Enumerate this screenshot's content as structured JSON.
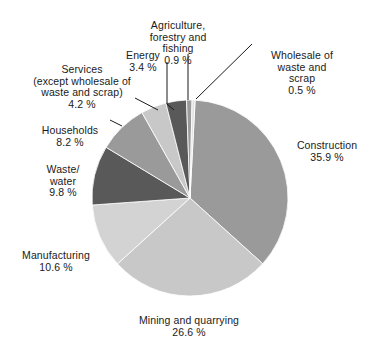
{
  "chart_data": {
    "type": "pie",
    "title": "",
    "unit": "%",
    "start_angle_deg": 3,
    "direction": "clockwise",
    "center": {
      "x": 190,
      "y": 198
    },
    "radius": 98,
    "categories": [
      "Construction",
      "Mining and quarrying",
      "Manufacturing",
      "Waste/ water",
      "Households",
      "Services (except wholesale of waste and scrap)",
      "Energy",
      "Agriculture, forestry and fishing",
      "Wholesale of waste and scrap"
    ],
    "values": [
      35.9,
      26.6,
      10.6,
      9.8,
      8.2,
      4.2,
      3.4,
      0.9,
      0.5
    ],
    "colors": [
      "#9a9a9a",
      "#c8c8c8",
      "#d3d3d3",
      "#595959",
      "#9a9a9a",
      "#c8c8c8",
      "#595959",
      "#9a9a9a",
      "#e2e2e2"
    ],
    "legend_position": "none",
    "grid": false,
    "slices": [
      {
        "name": "Construction",
        "value": 35.9,
        "value_label": "35.9 %",
        "color": "#9a9a9a"
      },
      {
        "name": "Mining and quarrying",
        "value": 26.6,
        "value_label": "26.6 %",
        "color": "#c8c8c8"
      },
      {
        "name": "Manufacturing",
        "value": 10.6,
        "value_label": "10.6 %",
        "color": "#d3d3d3"
      },
      {
        "name": "Waste/ water",
        "value": 9.8,
        "value_label": "9.8 %",
        "color": "#595959"
      },
      {
        "name": "Households",
        "value": 8.2,
        "value_label": "8.2 %",
        "color": "#9a9a9a"
      },
      {
        "name": "Services (except wholesale of waste and scrap)",
        "value": 4.2,
        "value_label": "4.2 %",
        "color": "#c8c8c8"
      },
      {
        "name": "Energy",
        "value": 3.4,
        "value_label": "3.4 %",
        "color": "#595959"
      },
      {
        "name": "Agriculture, forestry and fishing",
        "value": 0.9,
        "value_label": "0.9 %",
        "color": "#9a9a9a"
      },
      {
        "name": "Wholesale of waste and scrap",
        "value": 0.5,
        "value_label": "0.5 %",
        "color": "#e2e2e2"
      }
    ]
  },
  "labels": {
    "agriculture": {
      "name": "Agriculture,\nforestry and\nfishing",
      "value": "0.9 %"
    },
    "energy": {
      "name": "Energy",
      "value": "3.4 %"
    },
    "wholesale": {
      "name": "Wholesale of\nwaste and\nscrap",
      "value": "0.5 %"
    },
    "services": {
      "name": "Services\n(except wholesale of\nwaste and scrap)",
      "value": "4.2 %"
    },
    "households": {
      "name": "Households",
      "value": "8.2 %"
    },
    "waste_water": {
      "name": "Waste/\nwater",
      "value": "9.8 %"
    },
    "construction": {
      "name": "Construction",
      "value": "35.9 %"
    },
    "manufacturing": {
      "name": "Manufacturing",
      "value": "10.6 %"
    },
    "mining": {
      "name": "Mining and quarrying",
      "value": "26.6 %"
    }
  }
}
